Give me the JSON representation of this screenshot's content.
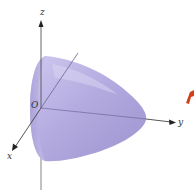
{
  "figure": {
    "type": "3d-surface-diagram",
    "surface": "elliptic paraboloid opening toward negative y-direction, vertex on positive y-axis",
    "colors": {
      "surface_fill": "#b8b0e0",
      "surface_shade": "#9e94d2",
      "surface_highlight": "#d6d0f0",
      "axis": "#555555",
      "arrow_accent": "#d2401e"
    },
    "axes": {
      "x": {
        "label": "x"
      },
      "y": {
        "label": "y"
      },
      "z": {
        "label": "z"
      },
      "origin": {
        "label": "O"
      }
    }
  }
}
